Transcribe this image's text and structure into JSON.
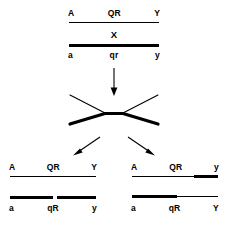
{
  "diagram": {
    "background_color": "#ffffff",
    "stroke_color": "#000000",
    "parent": {
      "caption_top": {
        "left": "A",
        "center": "QR",
        "right": "Y"
      },
      "caption_bottom": {
        "left": "a",
        "center": "qr",
        "right": "y"
      },
      "center_label": "X",
      "top_strand_style": "thin",
      "bottom_strand_style": "thick"
    },
    "crossover": {
      "label": "chiasma",
      "upper_strand_style": "thin",
      "lower_strand_style": "thick"
    },
    "products": [
      {
        "name": "recombinant-left",
        "top": {
          "caption": {
            "left": "A",
            "center": "QR",
            "right": "Y"
          },
          "segments": [
            {
              "style": "thin",
              "fraction": 1.0
            }
          ]
        },
        "bottom": {
          "caption": {
            "left": "a",
            "center": "qR",
            "right": "y"
          },
          "segments": [
            {
              "style": "thick",
              "fraction": 0.52
            },
            {
              "style": "gap",
              "fraction": 0.04
            },
            {
              "style": "thick",
              "fraction": 0.44
            }
          ]
        }
      },
      {
        "name": "recombinant-right",
        "top": {
          "caption": {
            "left": "A",
            "center": "QR",
            "right": "y"
          },
          "segments": [
            {
              "style": "thin",
              "fraction": 0.72
            },
            {
              "style": "thick",
              "fraction": 0.28
            }
          ]
        },
        "bottom": {
          "caption": {
            "left": "a",
            "center": "qR",
            "right": "Y"
          },
          "segments": [
            {
              "style": "thick",
              "fraction": 0.52
            },
            {
              "style": "thin",
              "fraction": 0.48
            }
          ]
        }
      }
    ],
    "arrows": {
      "down": {
        "name": "down-arrow",
        "direction": "down"
      },
      "split_left": {
        "name": "split-arrow-left",
        "direction": "down-left"
      },
      "split_right": {
        "name": "split-arrow-right",
        "direction": "down-right"
      }
    }
  }
}
